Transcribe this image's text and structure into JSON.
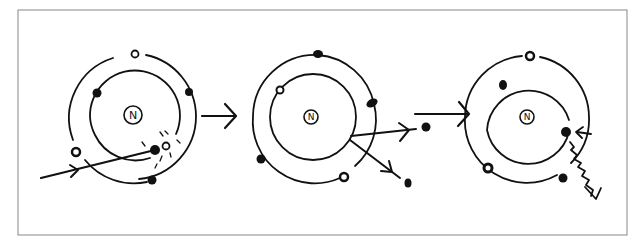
{
  "diagram": {
    "title": "",
    "frame": {
      "x": 18,
      "y": 10,
      "width": 609,
      "height": 225,
      "stroke": "#888888"
    },
    "ink_color": "#111111",
    "background": "#ffffff",
    "nucleus_label": "N",
    "atoms": [
      {
        "id": "atom-1",
        "stage": "incoming particle collides with inner-shell electron",
        "center": [
          133,
          117
        ],
        "inner_radius": 45,
        "outer_radius": 63,
        "electrons": [
          {
            "x": 135,
            "y": 54,
            "filled": false
          },
          {
            "x": 97,
            "y": 93,
            "filled": true
          },
          {
            "x": 189,
            "y": 92,
            "filled": true
          },
          {
            "x": 76,
            "y": 152,
            "filled": false
          },
          {
            "x": 155,
            "y": 150,
            "filled": true
          },
          {
            "x": 166,
            "y": 146,
            "filled": false
          },
          {
            "x": 152,
            "y": 180,
            "filled": true
          }
        ]
      },
      {
        "id": "atom-2",
        "stage": "electrons ejected from atom",
        "center": [
          313,
          117
        ],
        "inner_radius": 43,
        "outer_radius": 62,
        "electrons": [
          {
            "x": 318,
            "y": 54,
            "filled": true
          },
          {
            "x": 280,
            "y": 90,
            "filled": false
          },
          {
            "x": 372,
            "y": 103,
            "filled": true
          },
          {
            "x": 261,
            "y": 159,
            "filled": true
          },
          {
            "x": 344,
            "y": 177,
            "filled": false
          }
        ],
        "ejected": [
          {
            "x": 426,
            "y": 127
          },
          {
            "x": 408,
            "y": 183
          }
        ]
      },
      {
        "id": "atom-3",
        "stage": "vacancy filled with photon emission",
        "center": [
          527,
          117
        ],
        "inner_radius": 42,
        "outer_radius": 62,
        "electrons": [
          {
            "x": 530,
            "y": 56,
            "filled": false
          },
          {
            "x": 503,
            "y": 85,
            "filled": true
          },
          {
            "x": 566,
            "y": 132,
            "filled": true
          },
          {
            "x": 488,
            "y": 168,
            "filled": false
          },
          {
            "x": 563,
            "y": 178,
            "filled": true
          }
        ]
      }
    ],
    "transition_arrows": [
      {
        "from": "atom-1",
        "to": "atom-2",
        "x1": 202,
        "y1": 116,
        "x2": 235,
        "y2": 116
      },
      {
        "from": "atom-2",
        "to": "atom-3",
        "x1": 415,
        "y1": 114,
        "x2": 467,
        "y2": 114
      }
    ]
  }
}
